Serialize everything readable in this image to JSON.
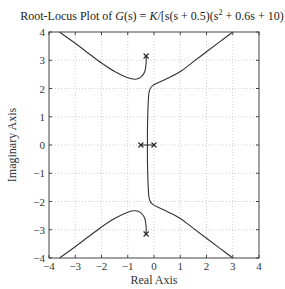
{
  "chart_data": {
    "type": "line",
    "title_parts": {
      "prefix": "Root-Locus Plot of ",
      "func": "G",
      "arg": "(s)",
      "eq": " = ",
      "K": "K",
      "rest": "/[s(s + 0.5)(s",
      "sup": "2",
      "tail": " + 0.6s + 10)]"
    },
    "xlabel": "Real Axis",
    "ylabel": "Imaginary Axis",
    "xlim": [
      -4,
      4
    ],
    "ylim": [
      -4,
      4
    ],
    "xticks": [
      -4,
      -3,
      -2,
      -1,
      0,
      1,
      2,
      3,
      4
    ],
    "yticks": [
      -4,
      -3,
      -2,
      -1,
      0,
      1,
      2,
      3,
      4
    ],
    "xtick_labels": [
      "−4",
      "−3",
      "−2",
      "−1",
      "0",
      "1",
      "2",
      "3",
      "4"
    ],
    "ytick_labels": [
      "−4",
      "−3",
      "−2",
      "−1",
      "0",
      "1",
      "2",
      "3",
      "4"
    ],
    "grid": true,
    "poles": [
      {
        "re": 0,
        "im": 0
      },
      {
        "re": -0.5,
        "im": 0
      },
      {
        "re": -0.3,
        "im": 3.15
      },
      {
        "re": -0.3,
        "im": -3.15
      }
    ],
    "series": [
      {
        "name": "branch-upper-left",
        "points": [
          [
            -0.3,
            3.15
          ],
          [
            -0.3,
            2.9
          ],
          [
            -0.35,
            2.6
          ],
          [
            -0.5,
            2.4
          ],
          [
            -0.7,
            2.33
          ],
          [
            -1.0,
            2.38
          ],
          [
            -1.5,
            2.6
          ],
          [
            -2.0,
            2.9
          ],
          [
            -2.5,
            3.25
          ],
          [
            -3.0,
            3.6
          ],
          [
            -3.6,
            4.0
          ]
        ]
      },
      {
        "name": "branch-lower-left",
        "points": [
          [
            -0.3,
            -3.15
          ],
          [
            -0.3,
            -2.9
          ],
          [
            -0.35,
            -2.6
          ],
          [
            -0.5,
            -2.4
          ],
          [
            -0.7,
            -2.33
          ],
          [
            -1.0,
            -2.38
          ],
          [
            -1.5,
            -2.6
          ],
          [
            -2.0,
            -2.9
          ],
          [
            -2.5,
            -3.25
          ],
          [
            -3.0,
            -3.6
          ],
          [
            -3.6,
            -4.0
          ]
        ]
      },
      {
        "name": "branch-upper-center",
        "points": [
          [
            -0.25,
            0
          ],
          [
            -0.25,
            0.5
          ],
          [
            -0.24,
            1.0
          ],
          [
            -0.22,
            1.5
          ],
          [
            -0.18,
            1.9
          ],
          [
            -0.05,
            2.1
          ],
          [
            0.5,
            2.35
          ],
          [
            1.0,
            2.6
          ],
          [
            1.5,
            2.95
          ],
          [
            2.0,
            3.3
          ],
          [
            2.5,
            3.65
          ],
          [
            3.0,
            4.0
          ]
        ]
      },
      {
        "name": "branch-lower-center",
        "points": [
          [
            -0.25,
            0
          ],
          [
            -0.25,
            -0.5
          ],
          [
            -0.24,
            -1.0
          ],
          [
            -0.22,
            -1.5
          ],
          [
            -0.18,
            -1.9
          ],
          [
            -0.05,
            -2.1
          ],
          [
            0.5,
            -2.35
          ],
          [
            1.0,
            -2.6
          ],
          [
            1.5,
            -2.95
          ],
          [
            2.0,
            -3.3
          ],
          [
            2.5,
            -3.65
          ],
          [
            3.0,
            -4.0
          ]
        ]
      },
      {
        "name": "real-axis-segment",
        "points": [
          [
            -0.5,
            0
          ],
          [
            0,
            0
          ]
        ]
      }
    ]
  }
}
